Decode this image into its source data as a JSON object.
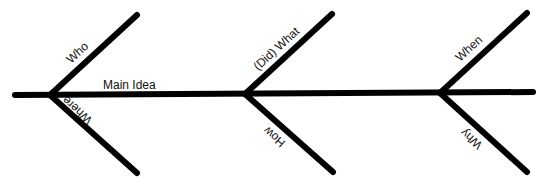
{
  "diagram": {
    "type": "fishbone",
    "main_label": "Main Idea",
    "colors": {
      "line": "#000000",
      "text": "#111111",
      "background": "#ffffff"
    },
    "spine": {
      "x1": 15,
      "y1": 95,
      "x2": 533,
      "y2": 92
    },
    "branches": [
      {
        "label": "Who",
        "position": "upper",
        "junction": [
          50,
          95
        ],
        "end": [
          137,
          15
        ]
      },
      {
        "label": "Where",
        "position": "lower",
        "junction": [
          50,
          95
        ],
        "end": [
          137,
          173
        ]
      },
      {
        "label": "(Did) What",
        "position": "upper",
        "junction": [
          245,
          94
        ],
        "end": [
          332,
          14
        ]
      },
      {
        "label": "How",
        "position": "lower",
        "junction": [
          245,
          94
        ],
        "end": [
          333,
          172
        ]
      },
      {
        "label": "When",
        "position": "upper",
        "junction": [
          440,
          93
        ],
        "end": [
          527,
          13
        ]
      },
      {
        "label": "Why",
        "position": "lower",
        "junction": [
          440,
          93
        ],
        "end": [
          527,
          172
        ]
      }
    ]
  }
}
